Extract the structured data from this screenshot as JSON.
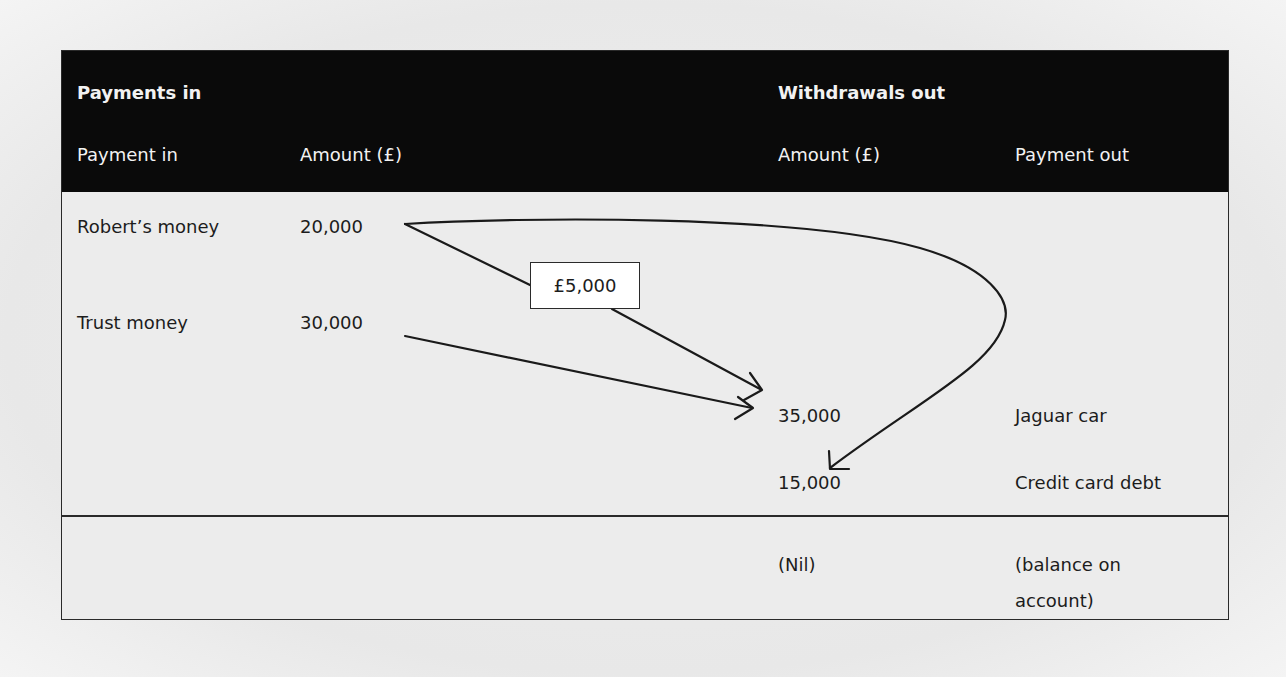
{
  "header": {
    "section_in": "Payments in",
    "section_out": "Withdrawals out",
    "columns": {
      "payment_in": "Payment in",
      "amount_in": "Amount (£)",
      "amount_out": "Amount (£)",
      "payment_out": "Payment out"
    }
  },
  "payments_in": [
    {
      "label": "Robert’s money",
      "amount": "20,000"
    },
    {
      "label": "Trust money",
      "amount": "30,000"
    }
  ],
  "withdrawals_out": [
    {
      "amount": "35,000",
      "label": "Jaguar car"
    },
    {
      "amount": "15,000",
      "label": "Credit card debt"
    }
  ],
  "balance": {
    "amount": "(Nil)",
    "label_line1": "(balance on",
    "label_line2": "account)"
  },
  "transfer_label": "£5,000",
  "flows": [
    {
      "from": "Robert’s money",
      "to": "Jaguar car",
      "amount": "£5,000"
    },
    {
      "from": "Trust money",
      "to": "Jaguar car",
      "amount": "30,000"
    },
    {
      "from": "Robert’s money",
      "to": "Credit card debt",
      "amount": "15,000"
    }
  ],
  "colors": {
    "header_bg": "#0a0a0a",
    "header_text": "#f2f2f2",
    "body_bg": "#ececec",
    "line": "#2a2a2a"
  }
}
